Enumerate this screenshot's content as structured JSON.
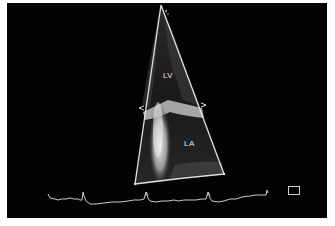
{
  "image": {
    "type": "echocardiogram",
    "view": "apical sector",
    "background_color": "#030303",
    "border_color": "#ffffff"
  },
  "labels": {
    "lv": "LV",
    "la": "LA"
  },
  "sector": {
    "apex": [
      161,
      5
    ],
    "bottom_left": [
      135,
      184
    ],
    "bottom_right": [
      224,
      174
    ],
    "marker_left": "<",
    "marker_right": ">"
  },
  "ecg": {
    "color": "#cfcfcf",
    "r_peak_x": [
      83,
      146,
      208
    ],
    "tick_marks_x": [
      146,
      208
    ]
  },
  "icons": {
    "frame_box": "square-outline-icon"
  }
}
